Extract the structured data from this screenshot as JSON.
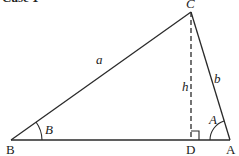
{
  "title": "Case 1",
  "vertices": {
    "B": "B",
    "D": "D",
    "A": "A",
    "C": "C"
  },
  "sides": {
    "a": "a",
    "b": "b",
    "h": "h"
  },
  "angles": {
    "B": "B",
    "A": "A"
  },
  "colors": {
    "line": "#2a2a2a",
    "background": "#ffffff"
  }
}
